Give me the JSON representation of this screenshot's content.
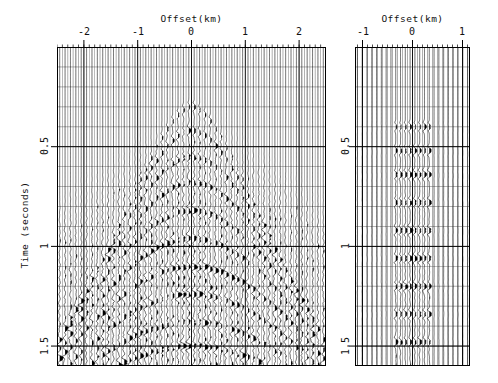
{
  "figure": {
    "background": "#ffffff",
    "ink": "#000000",
    "grid_color": "#555555",
    "trace_color": "#000000"
  },
  "chart_data": {
    "type": "line",
    "subtype": "seismic-wiggle-variable-area",
    "title": "",
    "panel_count": 2,
    "panels": [
      {
        "name": "left-gather",
        "xlabel": "Offset(km)",
        "ylabel": "Time (seconds)",
        "xlim": [
          -2.5,
          2.5
        ],
        "ylim": [
          0,
          1.6
        ],
        "x_ticks": [
          -2,
          -1,
          0,
          1,
          2
        ],
        "x_tick_labels": [
          "-2",
          "-1",
          "0",
          "1",
          "2"
        ],
        "x_minor_step": 0.1,
        "y_ticks": [
          0.5,
          1,
          1.5
        ],
        "y_tick_labels": [
          "0.5",
          "1",
          "1.5"
        ],
        "y_minor_step": 0.1,
        "grid": true,
        "y_axis_direction": "down",
        "x_axis_position": "top",
        "trace_count": 50,
        "trace_spacing_km": 0.1,
        "events": [
          {
            "t0": 0.3,
            "velocity_kms": 1.6,
            "polarity": "positive",
            "amplitude": 0.55
          },
          {
            "t0": 0.42,
            "velocity_kms": 1.7,
            "polarity": "positive",
            "amplitude": 0.7
          },
          {
            "t0": 0.55,
            "velocity_kms": 1.8,
            "polarity": "positive",
            "amplitude": 0.8
          },
          {
            "t0": 0.68,
            "velocity_kms": 1.9,
            "polarity": "positive",
            "amplitude": 0.85
          },
          {
            "t0": 0.82,
            "velocity_kms": 2.0,
            "polarity": "positive",
            "amplitude": 0.9
          },
          {
            "t0": 0.96,
            "velocity_kms": 2.1,
            "polarity": "positive",
            "amplitude": 0.95
          },
          {
            "t0": 1.1,
            "velocity_kms": 2.2,
            "polarity": "positive",
            "amplitude": 1.0
          },
          {
            "t0": 1.24,
            "velocity_kms": 2.3,
            "polarity": "positive",
            "amplitude": 1.0
          },
          {
            "t0": 1.38,
            "velocity_kms": 2.4,
            "polarity": "positive",
            "amplitude": 1.0
          },
          {
            "t0": 1.5,
            "velocity_kms": 2.5,
            "polarity": "positive",
            "amplitude": 1.0
          }
        ],
        "noise_level": 0.28,
        "description": "Common-midpoint gather with hyperbolic normal-moveout events widening with offset"
      },
      {
        "name": "right-gather",
        "xlabel": "Offset(km)",
        "ylabel": "Time (seconds)",
        "xlim": [
          -1.15,
          1.15
        ],
        "ylim": [
          0,
          1.6
        ],
        "x_ticks": [
          -1,
          0,
          1
        ],
        "x_tick_labels": [
          "-1",
          "0",
          "1"
        ],
        "x_minor_step": 0.1,
        "y_ticks": [
          0.5,
          1,
          1.5
        ],
        "y_tick_labels": [
          "0.5",
          "1",
          "1.5"
        ],
        "y_minor_step": 0.1,
        "grid": true,
        "y_axis_direction": "down",
        "x_axis_position": "top",
        "trace_count": 24,
        "trace_spacing_km": 0.1,
        "events": [
          {
            "t0": 0.4,
            "velocity_kms": 9.0,
            "polarity": "positive",
            "amplitude": 0.7
          },
          {
            "t0": 0.52,
            "velocity_kms": 9.0,
            "polarity": "positive",
            "amplitude": 0.85
          },
          {
            "t0": 0.64,
            "velocity_kms": 9.0,
            "polarity": "positive",
            "amplitude": 0.9
          },
          {
            "t0": 0.78,
            "velocity_kms": 9.0,
            "polarity": "positive",
            "amplitude": 0.95
          },
          {
            "t0": 0.92,
            "velocity_kms": 9.0,
            "polarity": "positive",
            "amplitude": 1.0
          },
          {
            "t0": 1.06,
            "velocity_kms": 9.0,
            "polarity": "positive",
            "amplitude": 1.0
          },
          {
            "t0": 1.2,
            "velocity_kms": 9.0,
            "polarity": "positive",
            "amplitude": 1.0
          },
          {
            "t0": 1.34,
            "velocity_kms": 9.0,
            "polarity": "positive",
            "amplitude": 1.0
          },
          {
            "t0": 1.48,
            "velocity_kms": 9.0,
            "polarity": "positive",
            "amplitude": 1.0
          }
        ],
        "noise_level": 0.1,
        "active_offset_range": [
          -0.35,
          0.35
        ],
        "description": "Narrow-aperture gather; energy concentrated near zero offset with near-flat events"
      }
    ]
  }
}
